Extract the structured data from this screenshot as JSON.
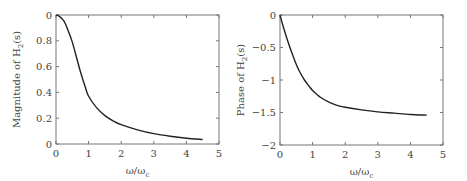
{
  "chart_data": [
    {
      "type": "line",
      "title": "",
      "xlabel": "ω/ωc",
      "xlabel_main": "ω/ω",
      "xlabel_sub": "c",
      "ylabel": "Magnitude of H2(s)",
      "ylabel_main": "Magnitude of H",
      "ylabel_sub": "2",
      "ylabel_tail": "(s)",
      "xlim": [
        0,
        5
      ],
      "ylim": [
        0,
        1
      ],
      "xticks": [
        0,
        1,
        2,
        3,
        4,
        5
      ],
      "xtick_labels": [
        "0",
        "1",
        "2",
        "3",
        "4",
        "5"
      ],
      "yticks": [
        0,
        0.2,
        0.4,
        0.6,
        0.8,
        1.0
      ],
      "ytick_labels": [
        "0",
        "0.2",
        "0.4",
        "0.6",
        "0.8",
        "0"
      ],
      "grid": false,
      "series": [
        {
          "name": "|H2(jω)|",
          "x": [
            0,
            0.1,
            0.25,
            0.4,
            0.5,
            0.6,
            0.75,
            0.9,
            1.0,
            1.25,
            1.5,
            1.75,
            2.0,
            2.5,
            3.0,
            3.5,
            4.0,
            4.5
          ],
          "values": [
            1.0,
            0.99,
            0.95,
            0.86,
            0.79,
            0.7,
            0.56,
            0.44,
            0.37,
            0.28,
            0.22,
            0.18,
            0.15,
            0.11,
            0.08,
            0.06,
            0.045,
            0.035
          ]
        }
      ]
    },
    {
      "type": "line",
      "title": "",
      "xlabel": "ω/ωc",
      "xlabel_main": "ω/ω",
      "xlabel_sub": "c",
      "ylabel": "Phase of H2(s)",
      "ylabel_main": "Phase of H",
      "ylabel_sub": "2",
      "ylabel_tail": "(s)",
      "xlim": [
        0,
        5
      ],
      "ylim": [
        -2,
        0
      ],
      "xticks": [
        0,
        1,
        2,
        3,
        4,
        5
      ],
      "xtick_labels": [
        "0",
        "1",
        "2",
        "3",
        "4",
        "5"
      ],
      "yticks": [
        -2,
        -1.5,
        -1,
        -0.5,
        0
      ],
      "ytick_labels": [
        "−2",
        "−1.5",
        "−1",
        "−0.5",
        "0"
      ],
      "grid": false,
      "series": [
        {
          "name": "∠H2(jω)",
          "x": [
            0,
            0.1,
            0.25,
            0.4,
            0.5,
            0.6,
            0.75,
            0.9,
            1.0,
            1.25,
            1.5,
            1.75,
            2.0,
            2.5,
            3.0,
            3.5,
            4.0,
            4.5
          ],
          "values": [
            0,
            -0.18,
            -0.42,
            -0.63,
            -0.76,
            -0.87,
            -1.0,
            -1.1,
            -1.16,
            -1.27,
            -1.34,
            -1.39,
            -1.42,
            -1.46,
            -1.49,
            -1.51,
            -1.53,
            -1.54
          ]
        }
      ]
    }
  ]
}
